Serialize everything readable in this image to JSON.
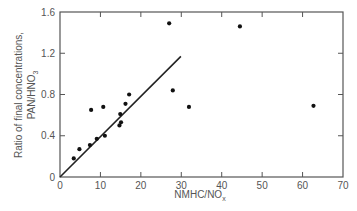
{
  "chart_data": {
    "type": "scatter",
    "title": "",
    "xlabel": "NMHC/NO_x",
    "xlabel_main": "NMHC/NO",
    "xlabel_sub": "x",
    "ylabel_line1": "Ratio of final concentrations,",
    "ylabel_line2_main": "PAN/HNO",
    "ylabel_line2_sub": "3",
    "xlim": [
      0,
      70
    ],
    "ylim": [
      0,
      1.6
    ],
    "xticks": [
      0,
      10,
      20,
      30,
      40,
      50,
      60,
      70
    ],
    "yticks": [
      0,
      0.4,
      0.8,
      1.2,
      1.6
    ],
    "xtick_labels": [
      "0",
      "10",
      "20",
      "30",
      "40",
      "50",
      "60",
      "70"
    ],
    "ytick_labels": [
      "0",
      "0.4",
      "0.8",
      "1.2",
      "1.6"
    ],
    "grid": false,
    "legend": null,
    "series": [
      {
        "name": "observations",
        "marker": "filled-circle",
        "points": [
          {
            "x": 3.4,
            "y": 0.18
          },
          {
            "x": 4.8,
            "y": 0.27
          },
          {
            "x": 7.4,
            "y": 0.31
          },
          {
            "x": 7.7,
            "y": 0.65
          },
          {
            "x": 9.1,
            "y": 0.37
          },
          {
            "x": 10.7,
            "y": 0.68
          },
          {
            "x": 11.1,
            "y": 0.4
          },
          {
            "x": 14.7,
            "y": 0.5
          },
          {
            "x": 15.1,
            "y": 0.53
          },
          {
            "x": 14.9,
            "y": 0.61
          },
          {
            "x": 16.2,
            "y": 0.71
          },
          {
            "x": 17.1,
            "y": 0.8
          },
          {
            "x": 27.0,
            "y": 1.49
          },
          {
            "x": 27.9,
            "y": 0.84
          },
          {
            "x": 31.9,
            "y": 0.68
          },
          {
            "x": 44.5,
            "y": 1.46
          },
          {
            "x": 62.7,
            "y": 0.69
          }
        ]
      },
      {
        "name": "fit-line",
        "type": "line",
        "points": [
          {
            "x": 0,
            "y": 0
          },
          {
            "x": 29.9,
            "y": 1.17
          }
        ]
      }
    ]
  },
  "colors": {
    "axis": "#555555",
    "marker": "#111111",
    "line": "#222222"
  }
}
